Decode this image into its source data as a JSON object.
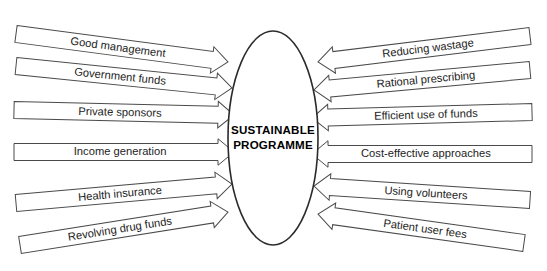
{
  "diagram": {
    "type": "converging-arrows",
    "background_color": "#ffffff",
    "stroke_color": "#4a4a4a",
    "text_color": "#1c1c1c",
    "center": {
      "shape": "ellipse",
      "line1": "SUSTAINABLE",
      "line2": "PROGRAMME",
      "cx": 273,
      "cy": 138,
      "rx": 45,
      "ry": 107
    },
    "left_arrows": [
      {
        "label": "Good management",
        "y_tail": 34,
        "y_tip": 62,
        "tail_x": 16,
        "tip_x": 228,
        "thickness": 17
      },
      {
        "label": "Government funds",
        "y_tail": 66,
        "y_tip": 88,
        "tail_x": 16,
        "tip_x": 232,
        "thickness": 17
      },
      {
        "label": "Private sponsors",
        "y_tail": 110,
        "y_tip": 115,
        "tail_x": 14,
        "tip_x": 234,
        "thickness": 17
      },
      {
        "label": "Income generation",
        "y_tail": 152,
        "y_tip": 152,
        "tail_x": 14,
        "tip_x": 234,
        "thickness": 17
      },
      {
        "label": "Health insurance",
        "y_tail": 203,
        "y_tip": 184,
        "tail_x": 16,
        "tip_x": 232,
        "thickness": 17
      },
      {
        "label": "Revolving drug funds",
        "y_tail": 245,
        "y_tip": 212,
        "tail_x": 20,
        "tip_x": 228,
        "thickness": 17
      }
    ],
    "right_arrows": [
      {
        "label": "Reducing wastage",
        "y_tail": 36,
        "y_tip": 62,
        "tail_x": 530,
        "tip_x": 318,
        "thickness": 17
      },
      {
        "label": "Rational prescribing",
        "y_tail": 70,
        "y_tip": 90,
        "tail_x": 530,
        "tip_x": 314,
        "thickness": 17
      },
      {
        "label": "Efficient use of funds",
        "y_tail": 112,
        "y_tip": 118,
        "tail_x": 532,
        "tip_x": 312,
        "thickness": 17
      },
      {
        "label": "Cost-effective approaches",
        "y_tail": 154,
        "y_tip": 154,
        "tail_x": 532,
        "tip_x": 312,
        "thickness": 17
      },
      {
        "label": "Using volunteers",
        "y_tail": 200,
        "y_tip": 186,
        "tail_x": 530,
        "tip_x": 314,
        "thickness": 17
      },
      {
        "label": "Patient user fees",
        "y_tail": 243,
        "y_tip": 214,
        "tail_x": 524,
        "tip_x": 318,
        "thickness": 17
      }
    ]
  }
}
